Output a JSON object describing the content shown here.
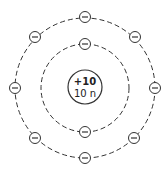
{
  "diagram": {
    "type": "bohr-atom-model",
    "nucleus": {
      "charge_label": "+10",
      "neutron_label": "10 n"
    },
    "shells": [
      {
        "name": "inner-shell",
        "electron_count": 2
      },
      {
        "name": "outer-shell",
        "electron_count": 8
      }
    ],
    "electron_symbol": "−",
    "colors": {
      "stroke": "#333333",
      "background": "#ffffff"
    }
  }
}
